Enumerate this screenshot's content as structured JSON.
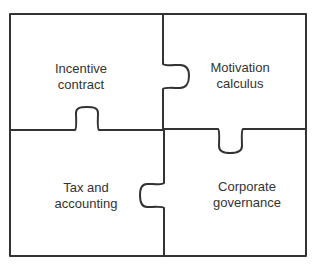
{
  "diagram": {
    "type": "jigsaw-puzzle",
    "line_color": "#333333",
    "background": "#ffffff",
    "pieces": [
      {
        "id": "top-left",
        "lines": [
          "Incentive",
          "contract"
        ],
        "position": "top-left"
      },
      {
        "id": "top-right",
        "lines": [
          "Motivation",
          "calculus"
        ],
        "position": "top-right"
      },
      {
        "id": "bottom-left",
        "lines": [
          "Tax and",
          "accounting"
        ],
        "position": "bottom-left"
      },
      {
        "id": "bottom-right",
        "lines": [
          "Corporate",
          "governance"
        ],
        "position": "bottom-right"
      }
    ]
  }
}
